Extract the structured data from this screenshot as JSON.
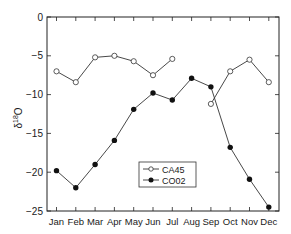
{
  "chart_data": {
    "type": "line",
    "title": "",
    "xlabel": "",
    "ylabel": "δ18O",
    "ylabel_main": "δ",
    "ylabel_sup": "18",
    "ylabel_end": "O",
    "categories": [
      "Jan",
      "Feb",
      "Mar",
      "Apr",
      "May",
      "Jun",
      "Jul",
      "Aug",
      "Sep",
      "Oct",
      "Nov",
      "Dec"
    ],
    "ylim": [
      -25,
      0
    ],
    "yticks": [
      0,
      -5,
      -10,
      -15,
      -20,
      -25
    ],
    "ytick_labels": [
      "0",
      "−5",
      "−10",
      "−15",
      "−20",
      "−25"
    ],
    "grid": false,
    "legend_position": "lower center-right inside plot",
    "series": [
      {
        "name": "CA45",
        "marker": "open-circle",
        "values": [
          -7.0,
          -8.4,
          -5.2,
          -5.0,
          -5.7,
          -7.5,
          -5.4,
          null,
          -11.2,
          -7.0,
          -5.5,
          -8.4
        ],
        "segments": [
          [
            0,
            6
          ],
          [
            8,
            11
          ]
        ]
      },
      {
        "name": "CO02",
        "marker": "filled-circle",
        "values": [
          -19.8,
          -22.0,
          -19.0,
          -15.9,
          -11.9,
          -9.8,
          -10.7,
          -7.9,
          -9.0,
          -16.8,
          -20.9,
          -24.5
        ],
        "segments": [
          [
            0,
            11
          ]
        ]
      }
    ]
  },
  "colors": {
    "line": "#333333",
    "axis": "#222222",
    "marker_fill_open": "#ffffff",
    "marker_fill_filled": "#111111"
  }
}
